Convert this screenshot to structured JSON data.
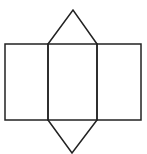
{
  "diagram": {
    "stroke_color": "#222222",
    "background_color": "#ffffff",
    "stroke_width": 1.5,
    "rectangles": [
      {
        "name": "left-face",
        "x": 5,
        "y": 44,
        "w": 43,
        "h": 76
      },
      {
        "name": "center-face",
        "x": 48,
        "y": 44,
        "w": 49,
        "h": 76
      },
      {
        "name": "right-face",
        "x": 97,
        "y": 44,
        "w": 44,
        "h": 76
      }
    ],
    "triangles": [
      {
        "name": "top-triangle",
        "points": "48,44 73,10 97,44"
      },
      {
        "name": "bottom-triangle",
        "points": "48,120 72,153 97,120"
      }
    ]
  }
}
